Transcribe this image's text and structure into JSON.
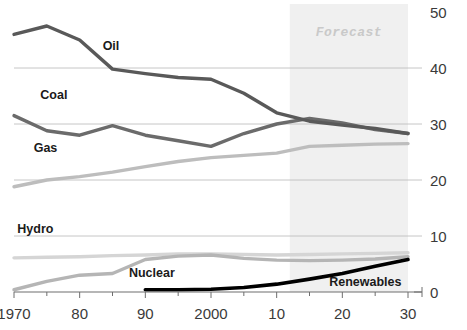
{
  "chart_data": {
    "type": "line",
    "title": "",
    "subtitle": "",
    "xlabel": "",
    "ylabel": "",
    "xlim": [
      1970,
      2030
    ],
    "ylim": [
      0,
      50
    ],
    "grid": true,
    "legend_position": "inline-labels",
    "y_ticks": [
      "0",
      "10",
      "20",
      "30",
      "40",
      "50"
    ],
    "y_tick_values": [
      0,
      10,
      20,
      30,
      40,
      50
    ],
    "x_ticks": [
      "1970",
      "80",
      "90",
      "2000",
      "10",
      "20",
      "30"
    ],
    "x_tick_values": [
      1970,
      1980,
      1990,
      2000,
      2010,
      2020,
      2030
    ],
    "x_minor_step": 5,
    "annotations": [
      {
        "text": "Forecast",
        "x_start": 2012,
        "x_end": 2030,
        "kind": "shaded-band"
      }
    ],
    "series": [
      {
        "name": "Oil",
        "color": "#595959",
        "width": 3.4,
        "label_x": 1983.5,
        "label_y": 43.2,
        "x": [
          1970,
          1975,
          1980,
          1985,
          1990,
          1995,
          2000,
          2005,
          2010,
          2015,
          2020,
          2025,
          2030
        ],
        "values": [
          46.0,
          47.5,
          45.0,
          39.8,
          39.0,
          38.3,
          38.0,
          35.5,
          32.0,
          30.5,
          29.8,
          29.2,
          28.3
        ]
      },
      {
        "name": "Coal",
        "color": "#6b6b6b",
        "width": 3.4,
        "label_x": 1974.0,
        "label_y": 34.5,
        "x": [
          1970,
          1975,
          1980,
          1985,
          1990,
          1995,
          2000,
          2005,
          2010,
          2015,
          2020,
          2025,
          2030
        ],
        "values": [
          31.5,
          28.8,
          28.0,
          29.7,
          28.0,
          27.0,
          26.0,
          28.3,
          30.0,
          31.0,
          30.2,
          29.0,
          28.3
        ]
      },
      {
        "name": "Gas",
        "color": "#bdbdbd",
        "width": 3.4,
        "label_x": 1973.0,
        "label_y": 25.0,
        "x": [
          1970,
          1975,
          1980,
          1985,
          1990,
          1995,
          2000,
          2005,
          2010,
          2015,
          2020,
          2025,
          2030
        ],
        "values": [
          18.8,
          20.0,
          20.6,
          21.4,
          22.4,
          23.3,
          24.0,
          24.4,
          24.8,
          26.0,
          26.2,
          26.4,
          26.5
        ]
      },
      {
        "name": "Hydro",
        "color": "#d5d5d5",
        "width": 3.4,
        "label_x": 1970.5,
        "label_y": 10.5,
        "x": [
          1970,
          1975,
          1980,
          1985,
          1990,
          1995,
          2000,
          2005,
          2010,
          2015,
          2020,
          2025,
          2030
        ],
        "values": [
          6.1,
          6.2,
          6.3,
          6.5,
          6.6,
          6.8,
          6.8,
          6.7,
          6.6,
          6.7,
          6.8,
          6.9,
          7.0
        ]
      },
      {
        "name": "Nuclear",
        "color": "#b5b5b5",
        "width": 3.4,
        "label_x": 1987.5,
        "label_y": 2.6,
        "x": [
          1970,
          1975,
          1980,
          1985,
          1990,
          1995,
          2000,
          2005,
          2010,
          2015,
          2020,
          2025,
          2030
        ],
        "values": [
          0.4,
          1.9,
          3.0,
          3.3,
          5.8,
          6.4,
          6.6,
          6.0,
          5.7,
          5.6,
          5.7,
          5.9,
          6.3
        ]
      },
      {
        "name": "Renewables",
        "color": "#000000",
        "width": 3.6,
        "label_x": 2018.0,
        "label_y": 1.0,
        "x": [
          1990,
          1995,
          2000,
          2005,
          2010,
          2015,
          2020,
          2025,
          2030
        ],
        "values": [
          0.4,
          0.4,
          0.5,
          0.8,
          1.4,
          2.3,
          3.3,
          4.6,
          5.8
        ]
      }
    ]
  }
}
